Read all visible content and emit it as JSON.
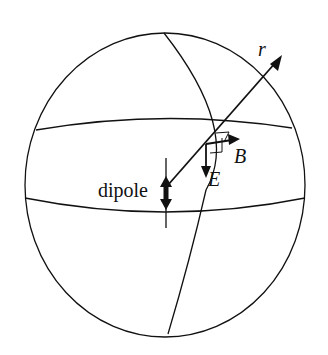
{
  "diagram": {
    "title": "",
    "labels": {
      "r": "r",
      "B": "B",
      "E": "E",
      "dipole": "dipole"
    },
    "colors": {
      "stroke": "#111111",
      "background": "#ffffff"
    }
  }
}
